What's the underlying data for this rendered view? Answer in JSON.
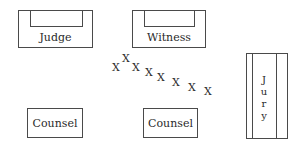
{
  "diagram": {
    "stations": {
      "judge": "Judge",
      "witness": "Witness",
      "counsel_left": "Counsel",
      "counsel_right": "Counsel",
      "jury_letters": [
        "J",
        "u",
        "r",
        "y"
      ]
    },
    "path_marker": "X",
    "path_marker_count": 9
  }
}
